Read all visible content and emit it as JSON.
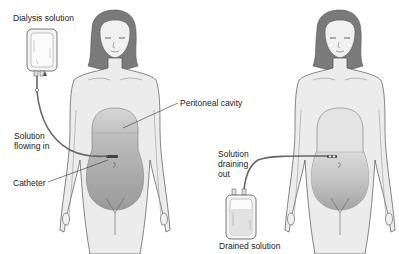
{
  "diagram": {
    "panels": [
      {
        "name": "filling",
        "labels": {
          "dialysis_solution": "Dialysis solution",
          "peritoneal_cavity": "Peritoneal cavity",
          "solution_flowing_in": "Solution\nflowing in",
          "catheter": "Catheter"
        }
      },
      {
        "name": "draining",
        "labels": {
          "solution_draining_out": "Solution\ndraining\nout",
          "drained_solution": "Drained solution"
        }
      }
    ],
    "colors": {
      "skin": "#ececec",
      "outline": "#555555",
      "hair": "#7a7a7a",
      "fluid": "#a8a8a8",
      "tube": "#666666",
      "bag": "#f4f4f4"
    }
  }
}
